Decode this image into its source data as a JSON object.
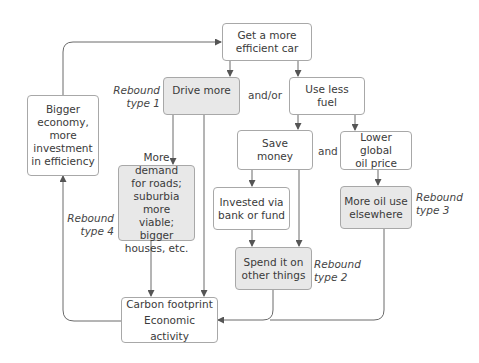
{
  "diagram": {
    "colors": {
      "box_fill": "#ffffff",
      "rebound_box_fill": "#e8e8e8",
      "border": "#a8a8a8",
      "arrow": "#555555",
      "text": "#3a3a3a"
    },
    "nodes": {
      "efficient_car": {
        "lines": [
          "Get a more",
          "efficient car"
        ],
        "rebound": false
      },
      "drive_more": {
        "lines": [
          "Drive more"
        ],
        "rebound": true
      },
      "use_less_fuel": {
        "lines": [
          "Use less",
          "fuel"
        ],
        "rebound": false
      },
      "bigger_economy": {
        "lines": [
          "Bigger",
          "economy,",
          "more",
          "investment",
          "in efficiency"
        ],
        "rebound": false
      },
      "save_money": {
        "lines": [
          "Save",
          "money"
        ],
        "rebound": false
      },
      "lower_oil_price": {
        "lines": [
          "Lower global",
          "oil price"
        ],
        "rebound": false
      },
      "more_demand": {
        "lines": [
          "More demand",
          "for roads;",
          "suburbia more",
          "viable; bigger",
          "houses, etc."
        ],
        "rebound": true
      },
      "invested": {
        "lines": [
          "Invested via",
          "bank or fund"
        ],
        "rebound": false
      },
      "more_oil_use": {
        "lines": [
          "More oil use",
          "elsewhere"
        ],
        "rebound": true
      },
      "spend_other": {
        "lines": [
          "Spend it on",
          "other things"
        ],
        "rebound": true
      },
      "carbon": {
        "lines": [
          "Carbon footprint",
          "Economic activity"
        ],
        "rebound": false
      }
    },
    "connectors": {
      "and_or": "and/or",
      "and": "and"
    },
    "rebound_labels": {
      "type1": [
        "Rebound",
        "type 1"
      ],
      "type2": [
        "Rebound",
        "type 2"
      ],
      "type3": [
        "Rebound",
        "type 3"
      ],
      "type4": [
        "Rebound",
        "type 4"
      ]
    },
    "edges": [
      {
        "from": "efficient_car",
        "to": "drive_more"
      },
      {
        "from": "efficient_car",
        "to": "use_less_fuel"
      },
      {
        "from": "use_less_fuel",
        "to": "save_money"
      },
      {
        "from": "use_less_fuel",
        "to": "lower_oil_price"
      },
      {
        "from": "drive_more",
        "to": "more_demand"
      },
      {
        "from": "drive_more",
        "to": "carbon"
      },
      {
        "from": "save_money",
        "to": "invested"
      },
      {
        "from": "save_money",
        "to": "spend_other"
      },
      {
        "from": "invested",
        "to": "spend_other"
      },
      {
        "from": "lower_oil_price",
        "to": "more_oil_use"
      },
      {
        "from": "more_demand",
        "to": "carbon"
      },
      {
        "from": "spend_other",
        "to": "carbon"
      },
      {
        "from": "more_oil_use",
        "to": "carbon"
      },
      {
        "from": "carbon",
        "to": "bigger_economy"
      },
      {
        "from": "bigger_economy",
        "to": "efficient_car"
      }
    ]
  }
}
